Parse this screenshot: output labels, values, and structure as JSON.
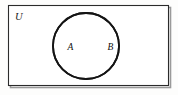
{
  "figure": {
    "kind": "venn-diagram",
    "width": 178,
    "height": 95,
    "background_color": "#fdfdfc"
  },
  "universe": {
    "label": "U",
    "label_x": 15,
    "label_y": 20,
    "label_font_size": 10.5,
    "rect": {
      "x": 8.5,
      "y": 5.5,
      "width": 160,
      "height": 80
    },
    "stroke_color": "#2b2b2b",
    "stroke_width": 1.1,
    "fill_color": "#ffffff"
  },
  "shadow": {
    "offset_x": 2,
    "offset_y": 2,
    "color": "#9a9a9a",
    "stroke_width": 1.6
  },
  "sets": [
    {
      "label": "A",
      "label_x": 67.5,
      "label_y": 50,
      "label_font_size": 9.5,
      "circle": {
        "cx": 86,
        "cy": 46,
        "r": 33
      },
      "stroke_color": "#141414",
      "stroke_width": 1.8
    },
    {
      "label": "B",
      "label_x": 107.5,
      "label_y": 50,
      "label_font_size": 9.5,
      "circle": {
        "cx": 86,
        "cy": 46,
        "r": 33
      },
      "stroke_color": "#141414",
      "stroke_width": 1.8
    }
  ]
}
